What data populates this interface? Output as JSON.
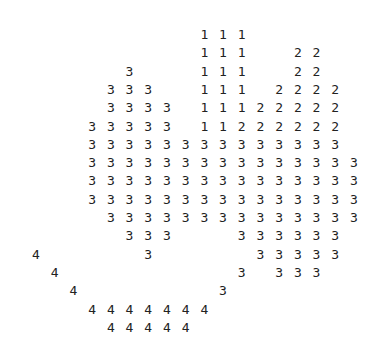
{
  "figure": {
    "layout": {
      "origin_x": 36,
      "origin_y": 35,
      "col_step": 18.7,
      "row_step": 18.3,
      "cols": 18,
      "rows": 17
    },
    "text_color": "#222222",
    "background": "#ffffff",
    "rows": [
      "         111      ",
      "         111  22  ",
      "     3   111  22  ",
      "    333  111 2222 ",
      "    3333 11122222 ",
      "   33333 11222222 ",
      "   33333333333333 ",
      "   333333333333333",
      "   333333333333333",
      "   333333333333333",
      "    33333333333333",
      "     333   333333 ",
      "4     3     33333 ",
      " 4         3 333  ",
      "  4       3       ",
      "   4444444        ",
      "    44444         "
    ]
  }
}
